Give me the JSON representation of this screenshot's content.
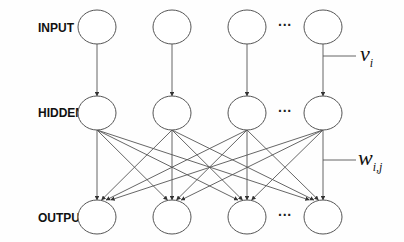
{
  "diagram": {
    "type": "feedforward-neural-network",
    "layers": [
      {
        "id": "input",
        "label": "INPUT",
        "nodes": 4,
        "ellipsis_after_index": 2
      },
      {
        "id": "hidden",
        "label": "HIDDEN",
        "nodes": 4,
        "ellipsis_after_index": 2
      },
      {
        "id": "output",
        "label": "OUTPUT",
        "nodes": 4,
        "ellipsis_after_index": 2
      }
    ],
    "connections": [
      {
        "from": "input",
        "to": "hidden",
        "pattern": "one-to-one",
        "weight_label": "v",
        "weight_subscript": "i"
      },
      {
        "from": "hidden",
        "to": "output",
        "pattern": "fully-connected",
        "weight_label": "w",
        "weight_subscript": "i,j"
      }
    ],
    "ellipsis": "···",
    "colors": {
      "stroke": "#555555",
      "text": "#111111",
      "background": "#fefefe"
    }
  }
}
